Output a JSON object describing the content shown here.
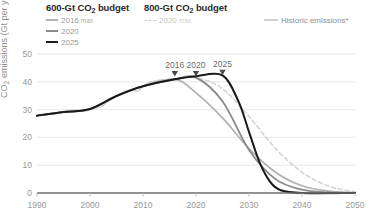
{
  "legend": {
    "groups": [
      {
        "title": "600-Gt CO₂ budget",
        "title_main": "600-Gt CO",
        "title_sub": "2",
        "title_tail": " budget",
        "items": [
          {
            "label": "2016",
            "suffix": "max",
            "color": "#b3b3b3",
            "style": "solid"
          },
          {
            "label": "2020",
            "suffix": "",
            "color": "#8a8a8a",
            "style": "solid"
          },
          {
            "label": "2025",
            "suffix": "",
            "color": "#1a1a1a",
            "style": "solid"
          }
        ]
      },
      {
        "title": "800-Gt CO₂ budget",
        "title_main": "800-Gt CO",
        "title_sub": "2",
        "title_tail": " budget",
        "items": [
          {
            "label": "2020",
            "suffix": "max",
            "color": "#d2d2d2",
            "style": "dashed"
          }
        ]
      }
    ],
    "historic": {
      "label": "Historic emissions",
      "marker": "*",
      "color": "#d2d2d2",
      "style": "solid"
    }
  },
  "chart_data": {
    "type": "line",
    "title": "",
    "xlabel": "",
    "ylabel": "CO₂ emissions (Gt per year)",
    "ylabel_main": "CO",
    "ylabel_sub": "2",
    "ylabel_tail": " emissions (Gt per year)",
    "xlim": [
      1990,
      2050
    ],
    "ylim": [
      0,
      50
    ],
    "xticks": [
      1990,
      2000,
      2010,
      2020,
      2030,
      2040,
      2050
    ],
    "yticks": [
      0,
      10,
      20,
      30,
      40,
      50
    ],
    "grid": "horizontal",
    "legend_position": "top",
    "annotations": [
      {
        "text": "2016",
        "x": 2016,
        "y": 41
      },
      {
        "text": "2020",
        "x": 2020,
        "y": 41
      },
      {
        "text": "2025",
        "x": 2025,
        "y": 41.5
      }
    ],
    "series": [
      {
        "name": "Historic emissions*",
        "color": "#d2d2d2",
        "style": "solid",
        "width": 1.6,
        "x": [
          1990,
          1991,
          1992,
          1993,
          1994,
          1995,
          1996,
          1997,
          1998,
          1999,
          2000,
          2001,
          2002,
          2003,
          2004,
          2005,
          2006,
          2007,
          2008,
          2009,
          2010,
          2011,
          2012,
          2013,
          2014,
          2015,
          2016
        ],
        "values": [
          27.8,
          28.4,
          28.3,
          28.4,
          28.6,
          29.1,
          29.6,
          29.8,
          29.7,
          29.5,
          30.2,
          30.6,
          31.0,
          32.4,
          33.8,
          34.9,
          35.9,
          36.8,
          37.2,
          36.6,
          38.4,
          39.6,
          40.1,
          40.5,
          40.7,
          40.6,
          40.9
        ]
      },
      {
        "name": "600-Gt 2016 max",
        "color": "#b3b3b3",
        "style": "solid",
        "width": 1.8,
        "x": [
          1990,
          1995,
          2000,
          2005,
          2010,
          2016,
          2020,
          2025,
          2030,
          2035,
          2040,
          2045,
          2050
        ],
        "values": [
          27.8,
          29.1,
          30.2,
          34.9,
          38.4,
          40.9,
          36.0,
          27.0,
          16.0,
          7.5,
          2.6,
          0.7,
          0.1
        ]
      },
      {
        "name": "600-Gt 2020 max",
        "color": "#8a8a8a",
        "style": "solid",
        "width": 1.8,
        "x": [
          1990,
          1995,
          2000,
          2005,
          2010,
          2016,
          2020,
          2025,
          2030,
          2035,
          2040,
          2045,
          2050
        ],
        "values": [
          27.8,
          29.1,
          30.2,
          34.9,
          38.4,
          40.9,
          41.5,
          33.0,
          15.5,
          5.0,
          1.2,
          0.2,
          0.0
        ]
      },
      {
        "name": "600-Gt 2025 max",
        "color": "#1a1a1a",
        "style": "solid",
        "width": 2.0,
        "x": [
          1990,
          1995,
          2000,
          2005,
          2010,
          2016,
          2020,
          2025,
          2028,
          2030,
          2032,
          2034,
          2036,
          2040,
          2050
        ],
        "values": [
          27.8,
          29.1,
          30.2,
          34.9,
          38.4,
          40.9,
          42.0,
          42.3,
          33.0,
          22.0,
          11.0,
          4.0,
          1.0,
          0.0,
          0.0
        ]
      },
      {
        "name": "800-Gt 2020 max",
        "color": "#d8d8d8",
        "style": "dashed",
        "width": 1.8,
        "x": [
          1990,
          1995,
          2000,
          2005,
          2010,
          2016,
          2020,
          2025,
          2030,
          2035,
          2040,
          2045,
          2050
        ],
        "values": [
          27.8,
          29.1,
          30.2,
          34.9,
          38.4,
          40.9,
          41.5,
          37.5,
          27.5,
          16.0,
          7.5,
          2.5,
          0.4
        ]
      }
    ]
  },
  "footnote": ""
}
